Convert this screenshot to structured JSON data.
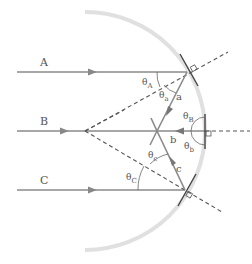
{
  "diagram": {
    "title": "",
    "rays": [
      {
        "id": "A",
        "label": "A",
        "y": 72
      },
      {
        "id": "B",
        "label": "B",
        "y": 131
      },
      {
        "id": "C",
        "label": "C",
        "y": 190
      }
    ],
    "reflected_rays": [
      {
        "id": "a",
        "label": "a"
      },
      {
        "id": "b",
        "label": "b"
      },
      {
        "id": "c",
        "label": "c"
      }
    ],
    "angles": {
      "theta_A": {
        "symbol": "θ",
        "sub": "A"
      },
      "theta_a": {
        "symbol": "θ",
        "sub": "a"
      },
      "theta_B": {
        "symbol": "θ",
        "sub": "B"
      },
      "theta_b": {
        "symbol": "θ",
        "sub": "b"
      },
      "theta_C": {
        "symbol": "θ",
        "sub": "C"
      },
      "theta_c": {
        "symbol": "θ",
        "sub": "c"
      }
    },
    "colors": {
      "arc": "#e0e0e0",
      "ray": "#8a8a8a",
      "normal": "#555555",
      "mirror": "#444444"
    }
  }
}
